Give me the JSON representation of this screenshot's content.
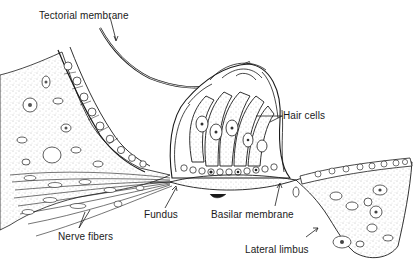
{
  "diagram": {
    "labels": {
      "tectorial_membrane": "Tectorial membrane",
      "hair_cells": "Hair cells",
      "nerve_fibers": "Nerve fibers",
      "fundus": "Fundus",
      "basilar_membrane": "Basilar membrane",
      "lateral_limbus": "Lateral limbus"
    },
    "colors": {
      "ink": "#1a1a1a",
      "stipple": "#6e6e6e",
      "background": "#ffffff"
    }
  }
}
